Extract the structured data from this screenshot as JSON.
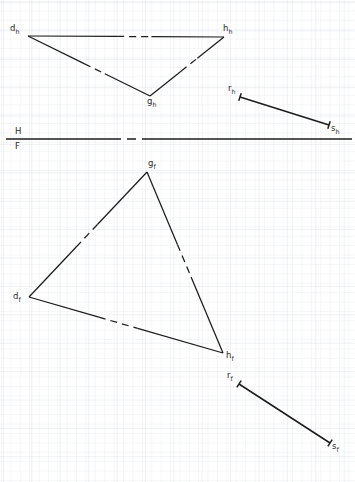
{
  "drawing": {
    "title": "Descriptive geometry: triangle DGH and line RS in two-view projection",
    "stroke_color": "#1c1c1c",
    "grid_color": "#a0aab9",
    "background_color": "#ffffff",
    "width": 355,
    "height": 482
  },
  "ground_line": {
    "name": "H/F folding line",
    "y": 139,
    "x_start": 6,
    "x_end": 352,
    "gap_start": 112,
    "gap_end": 146,
    "label_top": "H",
    "label_bottom": "F",
    "label_x": 15,
    "label_top_y": 127,
    "label_bottom_y": 142
  },
  "top_view": {
    "name": "horizontal projection (top view)",
    "points": [
      {
        "id": "d_h",
        "base": "d",
        "sub": "h",
        "x": 28,
        "y": 36,
        "label_x": 10,
        "label_y": 24
      },
      {
        "id": "h_h",
        "base": "h",
        "sub": "h",
        "x": 224,
        "y": 37,
        "label_x": 223,
        "label_y": 24
      },
      {
        "id": "g_h",
        "base": "g",
        "sub": "h",
        "x": 150,
        "y": 96,
        "label_x": 147,
        "label_y": 97
      },
      {
        "id": "r_h",
        "base": "r",
        "sub": "h",
        "x": 240,
        "y": 97,
        "label_x": 228,
        "label_y": 84
      },
      {
        "id": "s_h",
        "base": "s",
        "sub": "h",
        "x": 329,
        "y": 125,
        "label_x": 331,
        "label_y": 124
      }
    ],
    "edges": [
      {
        "from": "d_h",
        "to": "h_h",
        "gap_from": 0.455,
        "gap_to": 0.63
      },
      {
        "from": "d_h",
        "to": "g_h",
        "gap_from": 0.46,
        "gap_to": 0.63
      },
      {
        "from": "g_h",
        "to": "h_h",
        "gap_from": 0.42,
        "gap_to": 0.64
      }
    ],
    "segment": {
      "from": "r_h",
      "to": "s_h",
      "ticks": true
    }
  },
  "front_view": {
    "name": "frontal projection (front view)",
    "points": [
      {
        "id": "g_f",
        "base": "g",
        "sub": "f",
        "x": 147,
        "y": 172,
        "label_x": 148,
        "label_y": 159
      },
      {
        "id": "d_f",
        "base": "d",
        "sub": "f",
        "x": 29,
        "y": 297,
        "label_x": 13,
        "label_y": 292
      },
      {
        "id": "h_f",
        "base": "h",
        "sub": "f",
        "x": 223,
        "y": 353,
        "label_x": 226,
        "label_y": 351
      },
      {
        "id": "r_f",
        "base": "r",
        "sub": "f",
        "x": 239,
        "y": 384,
        "label_x": 227,
        "label_y": 371
      },
      {
        "id": "s_f",
        "base": "s",
        "sub": "f",
        "x": 330,
        "y": 443,
        "label_x": 332,
        "label_y": 442
      }
    ],
    "edges": [
      {
        "from": "d_f",
        "to": "g_f",
        "gap_from": 0.4,
        "gap_to": 0.58
      },
      {
        "from": "g_f",
        "to": "h_f",
        "gap_from": 0.4,
        "gap_to": 0.58
      },
      {
        "from": "d_f",
        "to": "h_f",
        "gap_from": 0.36,
        "gap_to": 0.56
      }
    ],
    "segment": {
      "from": "r_f",
      "to": "s_f",
      "ticks": true
    }
  }
}
